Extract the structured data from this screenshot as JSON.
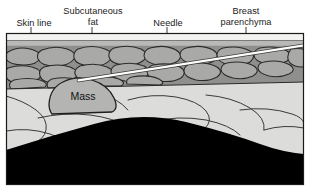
{
  "figure": {
    "type": "medical-illustration",
    "labels": {
      "skin_line": "Skin line",
      "subcutaneous_fat": "Subcutaneous\nfat",
      "needle": "Needle",
      "breast_parenchyma": "Breast\nparenchyma",
      "mass": "Mass"
    },
    "colors": {
      "frame": "#1a1a1a",
      "skin_band": "#f2f2f0",
      "dermis": "#b9b9b7",
      "fat_background": "#8f8f8d",
      "fat_lobule": "#a8a8a6",
      "fat_outline": "#2b2b2b",
      "parenchyma": "#dcdcda",
      "parenchyma_outline": "#3a3a3a",
      "mass_fill": "#b4b4b2",
      "mass_outline": "#1f1f1f",
      "shadow_black": "#000000",
      "needle": "#ffffff",
      "needle_edge": "#3c3c3c",
      "leader": "#3a3a3a"
    },
    "layers": [
      {
        "name": "skin line",
        "order": 1,
        "depth": "superficial"
      },
      {
        "name": "subcutaneous fat",
        "order": 2,
        "depth": "superficial"
      },
      {
        "name": "breast parenchyma",
        "order": 3,
        "depth": "middle"
      },
      {
        "name": "acoustic shadow / chest wall",
        "order": 4,
        "depth": "deep"
      }
    ],
    "leaders": [
      {
        "for": "skin_line",
        "x": 31,
        "y1": 28,
        "y2": 36
      },
      {
        "for": "subcutaneous_fat",
        "x": 92,
        "y1": 28,
        "y2": 36
      },
      {
        "for": "needle",
        "x": 167,
        "y1": 28,
        "y2": 58
      },
      {
        "for": "breast_parenchyma",
        "x": 246,
        "y1": 28,
        "y2": 120
      }
    ],
    "needle_path": {
      "x1": 309,
      "y1": 45,
      "x2": 79,
      "y2": 80,
      "note": "enters upper right, tip at top of mass"
    }
  }
}
